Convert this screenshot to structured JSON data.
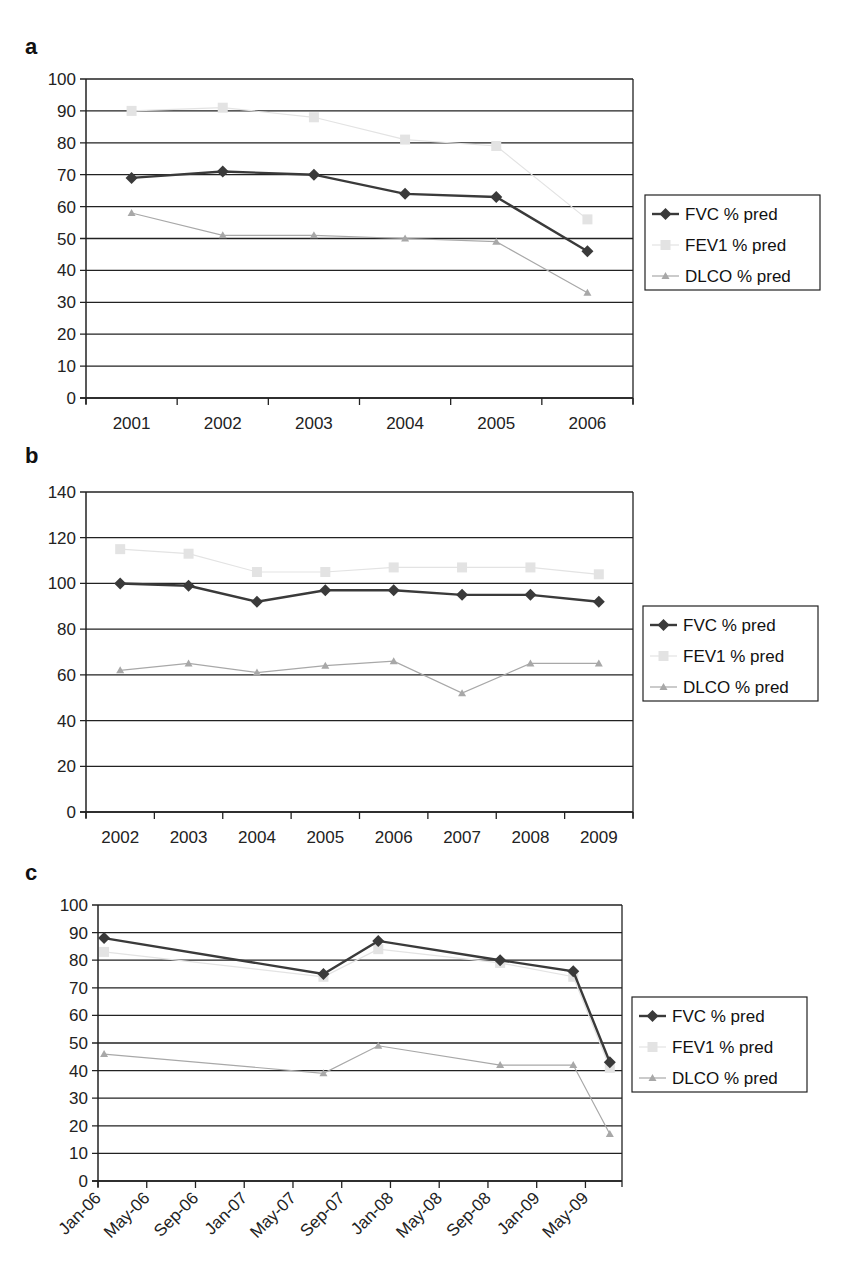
{
  "colors": {
    "fvc": "#3a3a3a",
    "fev1": "#e3e3e3",
    "dlco": "#a8a8a8",
    "grid": "#222222",
    "axis": "#222222"
  },
  "legend": [
    "FVC % pred",
    "FEV1 % pred",
    "DLCO % pred"
  ],
  "chart_data": [
    {
      "panel": "a",
      "type": "line",
      "title": "",
      "xlabel": "",
      "ylabel": "",
      "categories": [
        "2001",
        "2002",
        "2003",
        "2004",
        "2005",
        "2006"
      ],
      "yticks": [
        "0",
        "10",
        "20",
        "30",
        "40",
        "50",
        "60",
        "70",
        "80",
        "90",
        "100"
      ],
      "ylim": [
        0,
        100
      ],
      "grid": true,
      "legend_position": "right",
      "series": [
        {
          "name": "FVC % pred",
          "marker": "diamond",
          "values": [
            69,
            71,
            70,
            64,
            63,
            46
          ]
        },
        {
          "name": "FEV1 % pred",
          "marker": "square",
          "values": [
            90,
            91,
            88,
            81,
            79,
            56
          ]
        },
        {
          "name": "DLCO % pred",
          "marker": "triangle",
          "values": [
            58,
            51,
            51,
            50,
            49,
            33
          ]
        }
      ]
    },
    {
      "panel": "b",
      "type": "line",
      "title": "",
      "xlabel": "",
      "ylabel": "",
      "categories": [
        "2002",
        "2003",
        "2004",
        "2005",
        "2006",
        "2007",
        "2008",
        "2009"
      ],
      "yticks": [
        "0",
        "20",
        "40",
        "60",
        "80",
        "100",
        "120",
        "140"
      ],
      "ylim": [
        0,
        140
      ],
      "grid": true,
      "legend_position": "right",
      "series": [
        {
          "name": "FVC % pred",
          "marker": "diamond",
          "values": [
            100,
            99,
            92,
            97,
            97,
            95,
            95,
            92
          ]
        },
        {
          "name": "FEV1 % pred",
          "marker": "square",
          "values": [
            115,
            113,
            105,
            105,
            107,
            107,
            107,
            104
          ]
        },
        {
          "name": "DLCO % pred",
          "marker": "triangle",
          "values": [
            62,
            65,
            61,
            64,
            66,
            52,
            65,
            65
          ]
        }
      ]
    },
    {
      "panel": "c",
      "type": "line",
      "title": "",
      "xlabel": "",
      "ylabel": "",
      "x_tick_labels": [
        "Jan-06",
        "May-06",
        "Sep-06",
        "Jan-07",
        "May-07",
        "Sep-07",
        "Jan-08",
        "May-08",
        "Sep-08",
        "Jan-09",
        "May-09"
      ],
      "x": [
        "Jan-06",
        "Jul-07",
        "Dec-07",
        "Oct-08",
        "Apr-09",
        "Aug-09"
      ],
      "x_month_index": [
        0.5,
        18.5,
        23,
        33,
        39,
        42
      ],
      "yticks": [
        "0",
        "10",
        "20",
        "30",
        "40",
        "50",
        "60",
        "70",
        "80",
        "90",
        "100"
      ],
      "ylim": [
        0,
        100
      ],
      "grid": true,
      "legend_position": "right",
      "series": [
        {
          "name": "FVC % pred",
          "marker": "diamond",
          "values": [
            88,
            75,
            87,
            80,
            76,
            43
          ]
        },
        {
          "name": "FEV1 % pred",
          "marker": "square",
          "values": [
            83,
            74,
            84,
            79,
            74,
            41
          ]
        },
        {
          "name": "DLCO % pred",
          "marker": "triangle",
          "values": [
            46,
            39,
            49,
            42,
            42,
            17
          ]
        }
      ]
    }
  ]
}
